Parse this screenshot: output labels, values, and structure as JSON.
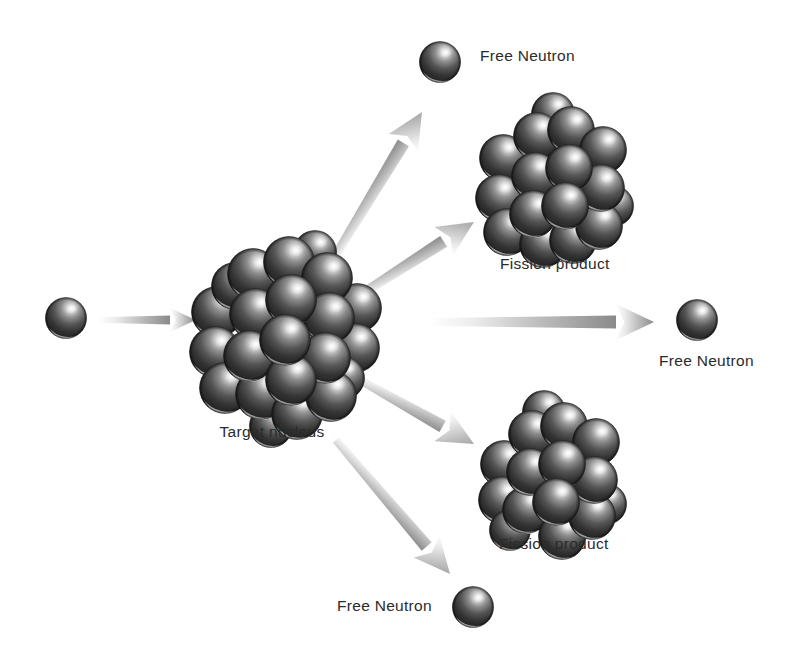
{
  "figure": {
    "background_color": "#ffffff",
    "label_color": "#2b2b2b",
    "sphere_color_dark": "#2e2e2e",
    "sphere_color_mid": "#6e6e6e",
    "sphere_color_light": "#e8e8e8",
    "arrow_color_head": "#8d8d8d",
    "arrow_color_tail": "#f2f2f2"
  },
  "labels": {
    "incoming_neutron": "",
    "target_nucleus": "Target nucleus",
    "free_neutron_top": "Free Neutron",
    "free_neutron_right": "Free Neutron",
    "free_neutron_bottom": "Free Neutron",
    "fission_product_top": "Fission product",
    "fission_product_bottom": "Fission product"
  },
  "objects": [
    {
      "name": "incoming-neutron",
      "kind": "single-neutron",
      "cx": 66,
      "cy": 318,
      "r": 21,
      "label": "",
      "label_x": 0,
      "label_y": 0
    },
    {
      "name": "target-nucleus",
      "kind": "nucleus-cluster",
      "cx": 275,
      "cy": 330,
      "radius": 78,
      "sphere_count": 22,
      "sphere_r": 25,
      "label": "Target nucleus",
      "label_x": 272,
      "label_y": 424
    },
    {
      "name": "free-neutron-top",
      "kind": "single-neutron",
      "cx": 440,
      "cy": 62,
      "r": 21,
      "label": "Free Neutron",
      "label_x": 480,
      "label_y": 48
    },
    {
      "name": "fission-product-top",
      "kind": "nucleus-cluster",
      "cx": 551,
      "cy": 184,
      "radius": 63,
      "sphere_count": 16,
      "sphere_r": 23,
      "label": "Fission product",
      "label_x": 570,
      "label_y": 258
    },
    {
      "name": "free-neutron-right",
      "kind": "single-neutron",
      "cx": 697,
      "cy": 320,
      "r": 21,
      "label": "Free Neutron",
      "label_x": 712,
      "label_y": 354
    },
    {
      "name": "fission-product-bottom",
      "kind": "nucleus-cluster",
      "cx": 548,
      "cy": 478,
      "radius": 60,
      "sphere_count": 15,
      "sphere_r": 23,
      "label": "Fission product",
      "label_x": 562,
      "label_y": 538
    },
    {
      "name": "free-neutron-bottom",
      "kind": "single-neutron",
      "cx": 473,
      "cy": 607,
      "r": 21,
      "label": "Free Neutron",
      "label_x": 404,
      "label_y": 600
    }
  ],
  "arrows": [
    {
      "name": "arrow-incoming",
      "x1": 100,
      "y1": 320,
      "x2": 196,
      "y2": 320,
      "width": 9,
      "head_len": 26,
      "head_w": 24
    },
    {
      "name": "arrow-to-free-neutron-top",
      "x1": 328,
      "y1": 268,
      "x2": 422,
      "y2": 112,
      "width": 13,
      "head_len": 36,
      "head_w": 34
    },
    {
      "name": "arrow-to-fission-product-top",
      "x1": 352,
      "y1": 300,
      "x2": 474,
      "y2": 222,
      "width": 13,
      "head_len": 36,
      "head_w": 34
    },
    {
      "name": "arrow-to-free-neutron-right",
      "x1": 434,
      "y1": 322,
      "x2": 654,
      "y2": 322,
      "width": 13,
      "head_len": 38,
      "head_w": 36
    },
    {
      "name": "arrow-to-fission-product-bottom",
      "x1": 360,
      "y1": 380,
      "x2": 474,
      "y2": 444,
      "width": 13,
      "head_len": 36,
      "head_w": 34
    },
    {
      "name": "arrow-to-free-neutron-bottom",
      "x1": 336,
      "y1": 440,
      "x2": 450,
      "y2": 574,
      "width": 13,
      "head_len": 36,
      "head_w": 34
    }
  ],
  "clusters": {
    "target_nucleus_spheres": [
      {
        "x": -58,
        "y": -18,
        "r": 26,
        "z": 1
      },
      {
        "x": -60,
        "y": 22,
        "r": 26,
        "z": 1
      },
      {
        "x": -50,
        "y": 58,
        "r": 26,
        "z": 1
      },
      {
        "x": -22,
        "y": -56,
        "r": 26,
        "z": 2
      },
      {
        "x": -20,
        "y": -16,
        "r": 26,
        "z": 3
      },
      {
        "x": -26,
        "y": 26,
        "r": 26,
        "z": 3
      },
      {
        "x": -14,
        "y": 64,
        "r": 26,
        "z": 2
      },
      {
        "x": 14,
        "y": -68,
        "r": 26,
        "z": 2
      },
      {
        "x": 16,
        "y": -30,
        "r": 26,
        "z": 4
      },
      {
        "x": 10,
        "y": 10,
        "r": 26,
        "z": 5
      },
      {
        "x": 16,
        "y": 50,
        "r": 26,
        "z": 4
      },
      {
        "x": 22,
        "y": 84,
        "r": 26,
        "z": 2
      },
      {
        "x": 52,
        "y": -52,
        "r": 26,
        "z": 2
      },
      {
        "x": 54,
        "y": -12,
        "r": 26,
        "z": 3
      },
      {
        "x": 50,
        "y": 28,
        "r": 26,
        "z": 3
      },
      {
        "x": 56,
        "y": 66,
        "r": 26,
        "z": 2
      },
      {
        "x": 82,
        "y": -22,
        "r": 25,
        "z": 1
      },
      {
        "x": 80,
        "y": 18,
        "r": 25,
        "z": 1
      },
      {
        "x": -40,
        "y": -44,
        "r": 24,
        "z": 1
      },
      {
        "x": 40,
        "y": -78,
        "r": 22,
        "z": 1
      },
      {
        "x": -4,
        "y": 96,
        "r": 22,
        "z": 1
      },
      {
        "x": 68,
        "y": 48,
        "r": 22,
        "z": 1
      }
    ],
    "fission_top_spheres": [
      {
        "x": -48,
        "y": -26,
        "r": 24,
        "z": 1
      },
      {
        "x": -52,
        "y": 14,
        "r": 24,
        "z": 1
      },
      {
        "x": -44,
        "y": 48,
        "r": 24,
        "z": 1
      },
      {
        "x": -14,
        "y": -48,
        "r": 24,
        "z": 2
      },
      {
        "x": -16,
        "y": -8,
        "r": 24,
        "z": 3
      },
      {
        "x": -18,
        "y": 30,
        "r": 24,
        "z": 3
      },
      {
        "x": -8,
        "y": 60,
        "r": 24,
        "z": 2
      },
      {
        "x": 20,
        "y": -54,
        "r": 24,
        "z": 2
      },
      {
        "x": 18,
        "y": -16,
        "r": 24,
        "z": 4
      },
      {
        "x": 14,
        "y": 22,
        "r": 24,
        "z": 4
      },
      {
        "x": 22,
        "y": 56,
        "r": 24,
        "z": 2
      },
      {
        "x": 52,
        "y": -34,
        "r": 24,
        "z": 2
      },
      {
        "x": 50,
        "y": 4,
        "r": 24,
        "z": 3
      },
      {
        "x": 48,
        "y": 42,
        "r": 24,
        "z": 2
      },
      {
        "x": 2,
        "y": -70,
        "r": 22,
        "z": 1
      },
      {
        "x": 62,
        "y": 22,
        "r": 21,
        "z": 1
      }
    ],
    "fission_bottom_spheres": [
      {
        "x": -44,
        "y": -14,
        "r": 24,
        "z": 1
      },
      {
        "x": -46,
        "y": 22,
        "r": 24,
        "z": 1
      },
      {
        "x": -16,
        "y": -44,
        "r": 24,
        "z": 2
      },
      {
        "x": -18,
        "y": -6,
        "r": 24,
        "z": 3
      },
      {
        "x": -22,
        "y": 32,
        "r": 24,
        "z": 2
      },
      {
        "x": 16,
        "y": -52,
        "r": 24,
        "z": 2
      },
      {
        "x": 14,
        "y": -14,
        "r": 24,
        "z": 4
      },
      {
        "x": 8,
        "y": 24,
        "r": 24,
        "z": 4
      },
      {
        "x": 14,
        "y": 58,
        "r": 24,
        "z": 2
      },
      {
        "x": 48,
        "y": -36,
        "r": 24,
        "z": 2
      },
      {
        "x": 46,
        "y": 2,
        "r": 24,
        "z": 3
      },
      {
        "x": 44,
        "y": 38,
        "r": 24,
        "z": 2
      },
      {
        "x": -4,
        "y": -66,
        "r": 22,
        "z": 1
      },
      {
        "x": 58,
        "y": 26,
        "r": 21,
        "z": 1
      },
      {
        "x": -38,
        "y": 52,
        "r": 21,
        "z": 1
      }
    ]
  }
}
